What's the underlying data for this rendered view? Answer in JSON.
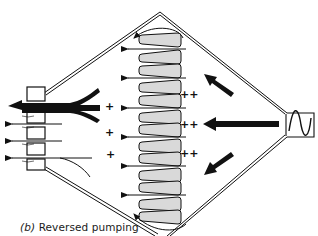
{
  "figure": {
    "caption_label": "(b)",
    "caption_text": "Reversed pumping",
    "ink_color": "#111111",
    "fin_fill": "#d9d9d9"
  },
  "diagram": {
    "shape": "diamond-chamber",
    "left_outlets": 4,
    "right_inlet_symbol": "sine-wave",
    "fin_stack_count": 12,
    "flow_arrows_through_fins": 6,
    "inflow_arrows_right": [
      "upper-left-diagonal",
      "horizontal-large",
      "lower-left-diagonal"
    ],
    "charge_markers": {
      "left_single": [
        "+",
        "+",
        "+"
      ],
      "right_double": [
        "++",
        "++",
        "++"
      ]
    }
  }
}
